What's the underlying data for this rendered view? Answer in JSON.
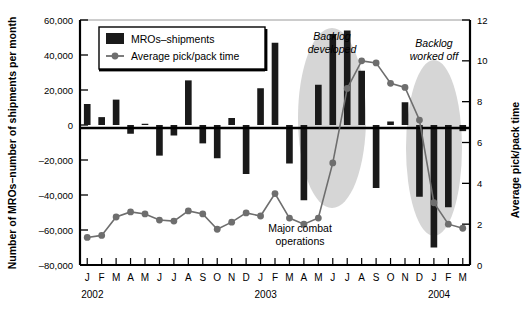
{
  "chart_data": {
    "type": "bar",
    "title": "",
    "subtitle": "",
    "xlabel": "",
    "ylabel": "Number of MROs–number of shipments per month",
    "y2label": "Average pick/pack time",
    "categories": [
      "J",
      "F",
      "M",
      "A",
      "M",
      "J",
      "J",
      "A",
      "S",
      "O",
      "N",
      "D",
      "J",
      "F",
      "M",
      "A",
      "M",
      "J",
      "J",
      "A",
      "S",
      "O",
      "N",
      "D",
      "J",
      "F",
      "M"
    ],
    "x_group_labels": [
      {
        "label": "2002",
        "start_index": 0,
        "end_index": 11
      },
      {
        "label": "2003",
        "start_index": 12,
        "end_index": 23
      },
      {
        "label": "2004",
        "start_index": 24,
        "end_index": 26
      }
    ],
    "ylim": [
      -80000,
      60000
    ],
    "yticks": [
      -80000,
      -60000,
      -40000,
      -20000,
      0,
      20000,
      40000,
      60000
    ],
    "ytick_labels": [
      "–80,000",
      "–60,000",
      "–40,000",
      "–20,000",
      "0",
      "20,000",
      "40,000",
      "60,000"
    ],
    "y2lim": [
      0,
      12
    ],
    "y2ticks": [
      0,
      2,
      4,
      6,
      8,
      10,
      12
    ],
    "y2tick_labels": [
      "0",
      "2",
      "4",
      "6",
      "8",
      "10",
      "12"
    ],
    "grid": false,
    "legend_position": "top-left",
    "series": [
      {
        "name": "MROs–shipments",
        "type": "bar",
        "axis": "left",
        "color": "#1a1a1a",
        "values": [
          12000,
          4500,
          14500,
          -5000,
          700,
          -17500,
          -6000,
          25500,
          -10500,
          -19000,
          4000,
          -28000,
          21000,
          47000,
          -22000,
          -43000,
          23000,
          52000,
          54000,
          31000,
          -36000,
          2000,
          13000,
          -41000,
          -70000,
          -47000,
          -3500
        ]
      },
      {
        "name": "Average pick/pack time",
        "type": "line",
        "axis": "right",
        "color": "#6e6e6e",
        "values": [
          1.35,
          1.45,
          2.35,
          2.6,
          2.5,
          2.2,
          2.15,
          2.65,
          2.5,
          1.75,
          2.1,
          2.55,
          2.4,
          3.5,
          2.3,
          2.0,
          2.3,
          5.0,
          8.65,
          10.0,
          9.9,
          8.9,
          8.7,
          7.1,
          3.05,
          2.0,
          1.8
        ]
      }
    ],
    "annotations": [
      {
        "name": "backlog-developed",
        "text_line1": "Backlog",
        "text_line2": "developed",
        "style": "italic"
      },
      {
        "name": "backlog-worked-off",
        "text_line1": "Backlog",
        "text_line2": "worked off",
        "style": "italic"
      },
      {
        "name": "major-combat-operations",
        "text_line1": "Major combat",
        "text_line2": "operations",
        "style": "plain"
      }
    ],
    "highlight_regions": [
      {
        "name": "backlog-developed-ellipse",
        "color": "#d6d6d6"
      },
      {
        "name": "backlog-worked-off-ellipse",
        "color": "#d6d6d6"
      }
    ]
  },
  "legend": {
    "items": [
      {
        "label": "MROs–shipments",
        "marker": "bar-swatch"
      },
      {
        "label": "Average pick/pack time",
        "marker": "line-dot-swatch"
      }
    ]
  },
  "colors": {
    "bar": "#1a1a1a",
    "line": "#6e6e6e",
    "ellipse": "#d6d6d6",
    "axis": "#000000",
    "background": "#ffffff"
  }
}
